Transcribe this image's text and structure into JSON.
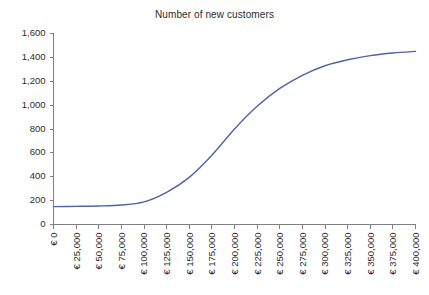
{
  "chart_data": {
    "type": "line",
    "title": "Number of new customers",
    "xlabel": "",
    "ylabel": "",
    "grid": false,
    "legend": false,
    "legend_position": "none",
    "xlim": [
      0,
      400000
    ],
    "ylim": [
      0,
      1600
    ],
    "y_tick_step": 200,
    "x_tick_step": 25000,
    "x_tick_labels": [
      "€ 0",
      "€ 25,000",
      "€ 50,000",
      "€ 75,000",
      "€ 100,000",
      "€ 125,000",
      "€ 150,000",
      "€ 175,000",
      "€ 200,000",
      "€ 225,000",
      "€ 250,000",
      "€ 275,000",
      "€ 300,000",
      "€ 325,000",
      "€ 350,000",
      "€ 375,000",
      "€ 400,000"
    ],
    "y_tick_labels": [
      "0",
      "200",
      "400",
      "600",
      "800",
      "1,000",
      "1,200",
      "1,400",
      "1,600"
    ],
    "x": [
      0,
      25000,
      50000,
      75000,
      100000,
      125000,
      150000,
      175000,
      200000,
      225000,
      250000,
      275000,
      300000,
      325000,
      350000,
      375000,
      400000
    ],
    "series": [
      {
        "name": "Number of new customers",
        "color": "#4f62a8",
        "values": [
          150,
          152,
          155,
          163,
          190,
          270,
          395,
          580,
          800,
          990,
          1140,
          1250,
          1330,
          1380,
          1415,
          1437,
          1450
        ]
      }
    ]
  },
  "colors": {
    "line": "#4f62a8",
    "axis": "#808080",
    "text": "#2b2b2b",
    "background": "#ffffff"
  }
}
